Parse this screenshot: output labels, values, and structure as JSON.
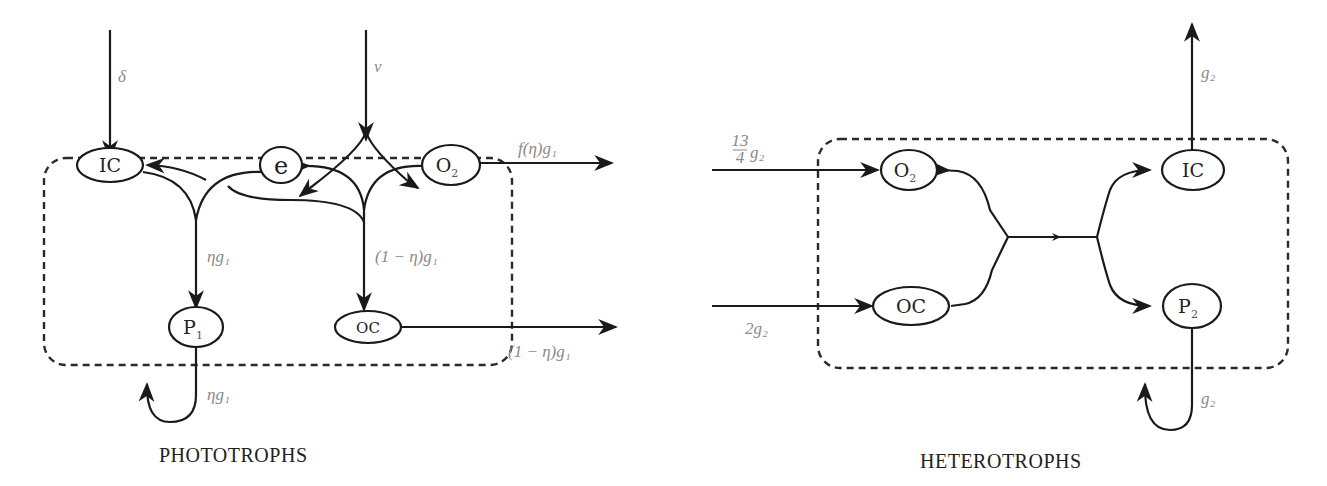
{
  "phototrophs": {
    "caption": "PHOTOTROPHS",
    "nodes": {
      "ic": {
        "label": "IC"
      },
      "e": {
        "label": "e"
      },
      "o2": {
        "label": "O",
        "sub": "2"
      },
      "p1": {
        "label": "P",
        "sub": "1"
      },
      "oc": {
        "label": "OC"
      }
    },
    "flows": {
      "delta": "δ",
      "nu": "ν",
      "f_eta_g1": "f(η)g₁",
      "eta_g1_internal": "ηg₁",
      "one_minus_eta_g1_internal": "(1 − η)g₁",
      "one_minus_eta_g1_out": "(1 − η)g₁",
      "eta_g1_loop": "ηg₁"
    }
  },
  "heterotrophs": {
    "caption": "HETEROTROPHS",
    "nodes": {
      "o2": {
        "label": "O",
        "sub": "2"
      },
      "oc": {
        "label": "OC"
      },
      "ic": {
        "label": "IC"
      },
      "p2": {
        "label": "P",
        "sub": "2"
      }
    },
    "flows": {
      "o2_in_num": "13",
      "o2_in_den": "4",
      "o2_in_g": "g₂",
      "oc_in": "2g₂",
      "ic_out": "g₂",
      "p2_loop": "g₂"
    }
  },
  "colors": {
    "line": "#1a1a1a",
    "label": "#8a8a8a",
    "box": "#2a2a2a"
  }
}
